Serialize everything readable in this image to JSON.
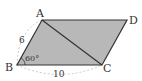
{
  "figure": {
    "shape": "parallelogram",
    "fill_color": "#b8b8b8",
    "edge_color": "#333333",
    "vertices": {
      "A": {
        "label": "A",
        "x": 42,
        "y": 20
      },
      "B": {
        "label": "B",
        "x": 17,
        "y": 65
      },
      "C": {
        "label": "C",
        "x": 102,
        "y": 65
      },
      "D": {
        "label": "D",
        "x": 127,
        "y": 20
      }
    },
    "diagonal": "AC",
    "side_AB_label": "6",
    "side_BC_label": "10",
    "angle_B_label": "60°"
  }
}
